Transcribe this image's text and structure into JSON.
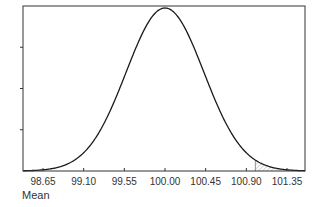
{
  "chart_data": {
    "type": "line",
    "title": "",
    "xlabel": "Mean",
    "ylabel": "",
    "distribution": "normal",
    "mean": 100.0,
    "sd": 0.43,
    "x_ticks": [
      98.65,
      99.1,
      99.55,
      100.0,
      100.45,
      100.9,
      101.35
    ],
    "x_tick_labels": [
      "98.65",
      "99.10",
      "99.55",
      "100.00",
      "100.45",
      "100.90",
      "101.35"
    ],
    "xlim": [
      98.4,
      101.55
    ],
    "y_ticks_count": 4,
    "y_tick_labels": [],
    "shaded_region": {
      "from": 101.0,
      "to": 101.55,
      "style": "diagonal-hatch",
      "side": "upper-tail"
    },
    "grid": false,
    "legend": null
  },
  "layout": {
    "plot": {
      "left": 23,
      "top": 6,
      "right": 305,
      "bottom": 171
    },
    "colors": {
      "curve": "#1a1a1a",
      "axis": "#333333",
      "hatch": "#888888"
    }
  }
}
